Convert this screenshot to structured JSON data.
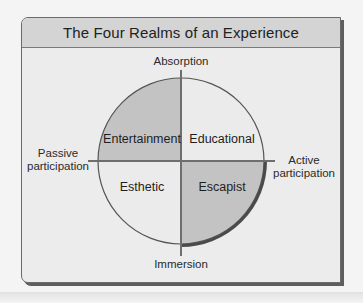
{
  "title": "The Four Realms of an Experience",
  "axes": {
    "top": "Absorption",
    "bottom": "Immersion",
    "left_line1": "Passive",
    "left_line2": "participation",
    "right_line1": "Active",
    "right_line2": "participation"
  },
  "quadrants": [
    {
      "position": "top-left",
      "label": "Entertainment",
      "shaded": true
    },
    {
      "position": "top-right",
      "label": "Educational",
      "shaded": false
    },
    {
      "position": "bottom-left",
      "label": "Esthetic",
      "shaded": false
    },
    {
      "position": "bottom-right",
      "label": "Escapist",
      "shaded": true
    }
  ],
  "colors": {
    "shaded": "#c3c3c3",
    "light": "#ebebeb",
    "axis": "#6e6e6e",
    "outline": "#555555"
  }
}
